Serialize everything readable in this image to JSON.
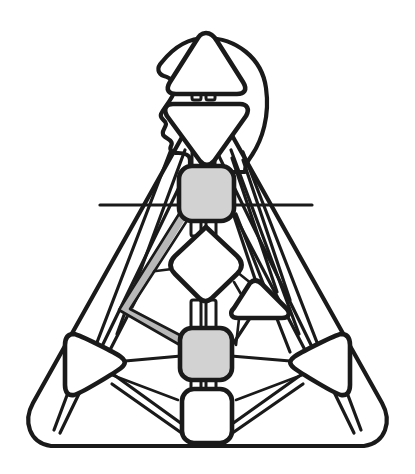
{
  "figure": {
    "title": "Stylized triangular network diagram with human head profile",
    "background_color": "#ffffff",
    "stroke_color": "#1a1a1a",
    "node_gray_fill": "#d2d2d2",
    "node_white_fill": "#ffffff",
    "highlight_color": "#b8b8b8",
    "canvas": {
      "width": 415,
      "height": 474
    }
  },
  "outer_frame": {
    "name": "outer-rounded-triangle",
    "shape": "rounded-triangle",
    "apex": {
      "x": 207,
      "y": 128
    },
    "bottom_left": {
      "x": 28,
      "y": 448
    },
    "bottom_right": {
      "x": 386,
      "y": 448
    },
    "corner_radius": 34
  },
  "head": {
    "name": "head-profile",
    "description": "Human head shown in left-facing profile with nose, lips and chin",
    "center": {
      "x": 207,
      "y": 95
    },
    "features": [
      "forehead",
      "nose",
      "lips",
      "chin",
      "cranium"
    ]
  },
  "nodes": [
    {
      "id": "n-apex-triangle",
      "name": "apex-up-triangle-node",
      "shape": "triangle-up",
      "fill": "#ffffff",
      "cx": 206,
      "cy": 60,
      "size": 42
    },
    {
      "id": "n-inverted-triangle",
      "name": "inverted-triangle-node",
      "shape": "triangle-down",
      "fill": "#ffffff",
      "cx": 206,
      "cy": 120,
      "size": 42
    },
    {
      "id": "n-upper-gray-box",
      "name": "upper-gray-square-node",
      "shape": "rounded-square",
      "fill": "#d2d2d2",
      "cx": 206,
      "cy": 192,
      "size": 52
    },
    {
      "id": "n-diamond",
      "name": "center-diamond-node",
      "shape": "diamond",
      "fill": "#ffffff",
      "cx": 206,
      "cy": 265,
      "size": 40
    },
    {
      "id": "n-lower-gray-box",
      "name": "lower-gray-square-node",
      "shape": "rounded-square",
      "fill": "#d2d2d2",
      "cx": 206,
      "cy": 353,
      "size": 50
    },
    {
      "id": "n-bottom-white-box",
      "name": "bottom-white-square-node",
      "shape": "rounded-square",
      "fill": "#ffffff",
      "cx": 206,
      "cy": 427,
      "size": 48
    },
    {
      "id": "n-left-triangle",
      "name": "left-right-pointing-triangle-node",
      "shape": "triangle-right",
      "fill": "#ffffff",
      "cx": 90,
      "cy": 364,
      "size": 40
    },
    {
      "id": "n-right-triangle",
      "name": "right-left-pointing-triangle-node",
      "shape": "triangle-left",
      "fill": "#ffffff",
      "cx": 325,
      "cy": 364,
      "size": 40
    },
    {
      "id": "n-mid-right-triangle",
      "name": "mid-right-small-triangle-node",
      "shape": "triangle-right",
      "fill": "#ffffff",
      "cx": 267,
      "cy": 303,
      "size": 30
    }
  ],
  "highlighted_path": {
    "name": "highlighted-route",
    "color": "#b8b8b8",
    "from": "n-upper-gray-box",
    "via": {
      "x": 124,
      "y": 309
    },
    "to": "n-lower-gray-box"
  },
  "edge_count": 22,
  "connectors": {
    "name": "double-bar-connector",
    "description": "Short paired vertical bars linking stacked central nodes",
    "locations": [
      {
        "x": 206,
        "y": 94
      },
      {
        "x": 206,
        "y": 160
      },
      {
        "x": 206,
        "y": 228
      },
      {
        "x": 206,
        "y": 320
      },
      {
        "x": 206,
        "y": 393
      }
    ]
  }
}
